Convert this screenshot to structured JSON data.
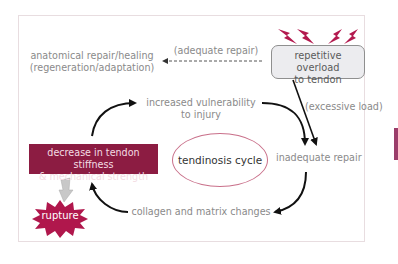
{
  "diagram": {
    "title": "tendinosis cycle",
    "nodes": {
      "anatomical_repair": {
        "line1": "anatomical repair/healing",
        "line2": "(regeneration/adaptation)"
      },
      "repetitive_overload": {
        "line1": "repetitive overload",
        "line2": "to tendon"
      },
      "increased_vulnerability": {
        "line1": "increased vulnerability",
        "line2": "to injury"
      },
      "inadequate_repair": {
        "label": "inadequate repair"
      },
      "collagen_changes": {
        "label": "collagen and matrix changes"
      },
      "decrease_stiffness": {
        "line1": "decrease in tendon stiffness",
        "line2": "& mechanical strength"
      },
      "rupture": {
        "label": "rupture"
      },
      "center": {
        "label": "tendinosis cycle"
      }
    },
    "edge_labels": {
      "adequate_repair": "(adequate repair)",
      "excessive_load": "(excessive load)"
    },
    "icons": {
      "load_bolts": "lightning-bolt-icon",
      "rupture_burst": "starburst-icon",
      "rupture_arrow": "gray-down-arrow-icon"
    },
    "colors": {
      "accent": "#8c1c42",
      "rupture": "#b0174c",
      "bolt": "#b3194e",
      "text_gray": "#8a8a8a",
      "ellipse_border": "#c9708a",
      "side_bar": "#9b3d6a"
    }
  }
}
